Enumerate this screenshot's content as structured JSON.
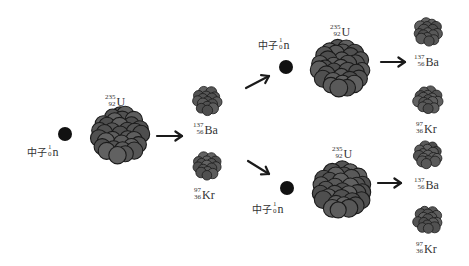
{
  "diagram": {
    "type": "nuclear-fission-chain-reaction",
    "neutron_label": {
      "prefix": "中子",
      "mass": "1",
      "atomic": "0",
      "symbol": "n"
    },
    "nodes": [
      {
        "id": "neutron-1",
        "kind": "neutron",
        "cx": 65,
        "cy": 134,
        "r": 7,
        "label_pos": [
          27,
          144
        ]
      },
      {
        "id": "uranium-1",
        "kind": "nucleus",
        "element": "U",
        "mass": "235",
        "atomic": "92",
        "cx": 120,
        "cy": 135,
        "r": 31,
        "label_pos": [
          105,
          90
        ]
      },
      {
        "id": "barium-1",
        "kind": "fragment",
        "element": "Ba",
        "mass": "137",
        "atomic": "56",
        "cx": 207,
        "cy": 101,
        "r": 15,
        "label_pos": [
          193,
          118
        ]
      },
      {
        "id": "krypton-1",
        "kind": "fragment",
        "element": "Kr",
        "mass": "97",
        "atomic": "36",
        "cx": 207,
        "cy": 166,
        "r": 15,
        "label_pos": [
          194,
          183
        ]
      },
      {
        "id": "neutron-2",
        "kind": "neutron",
        "cx": 286,
        "cy": 67,
        "r": 7,
        "label_pos": [
          258,
          37
        ]
      },
      {
        "id": "uranium-2",
        "kind": "nucleus",
        "element": "U",
        "mass": "235",
        "atomic": "92",
        "cx": 341,
        "cy": 68,
        "r": 31,
        "label_pos": [
          330,
          20
        ]
      },
      {
        "id": "neutron-3",
        "kind": "neutron",
        "cx": 287,
        "cy": 188,
        "r": 7,
        "label_pos": [
          252,
          201
        ]
      },
      {
        "id": "uranium-3",
        "kind": "nucleus",
        "element": "U",
        "mass": "235",
        "atomic": "92",
        "cx": 342,
        "cy": 190,
        "r": 31,
        "label_pos": [
          332,
          142
        ]
      },
      {
        "id": "barium-2",
        "kind": "fragment",
        "element": "Ba",
        "mass": "137",
        "atomic": "56",
        "cx": 428,
        "cy": 32,
        "r": 15,
        "label_pos": [
          414,
          50
        ]
      },
      {
        "id": "krypton-2",
        "kind": "fragment",
        "element": "Kr",
        "mass": "97",
        "atomic": "36",
        "cx": 428,
        "cy": 100,
        "r": 15,
        "label_pos": [
          416,
          117
        ]
      },
      {
        "id": "barium-3",
        "kind": "fragment",
        "element": "Ba",
        "mass": "137",
        "atomic": "56",
        "cx": 428,
        "cy": 155,
        "r": 15,
        "label_pos": [
          414,
          173
        ]
      },
      {
        "id": "krypton-3",
        "kind": "fragment",
        "element": "Kr",
        "mass": "97",
        "atomic": "36",
        "cx": 428,
        "cy": 220,
        "r": 15,
        "label_pos": [
          416,
          237
        ]
      }
    ],
    "arrows": [
      {
        "id": "arrow-1",
        "x1": 157,
        "y1": 136,
        "x2": 182,
        "y2": 136
      },
      {
        "id": "arrow-2",
        "x1": 246,
        "y1": 88,
        "x2": 269,
        "y2": 76
      },
      {
        "id": "arrow-3",
        "x1": 248,
        "y1": 161,
        "x2": 269,
        "y2": 174
      },
      {
        "id": "arrow-4",
        "x1": 381,
        "y1": 62,
        "x2": 405,
        "y2": 62
      },
      {
        "id": "arrow-5",
        "x1": 378,
        "y1": 183,
        "x2": 401,
        "y2": 183
      }
    ],
    "colors": {
      "nucleon_fill": "#5a5a5a",
      "nucleon_stroke": "#1a1a1a",
      "neutron": "#111111",
      "arrow": "#1a1a1a"
    }
  }
}
